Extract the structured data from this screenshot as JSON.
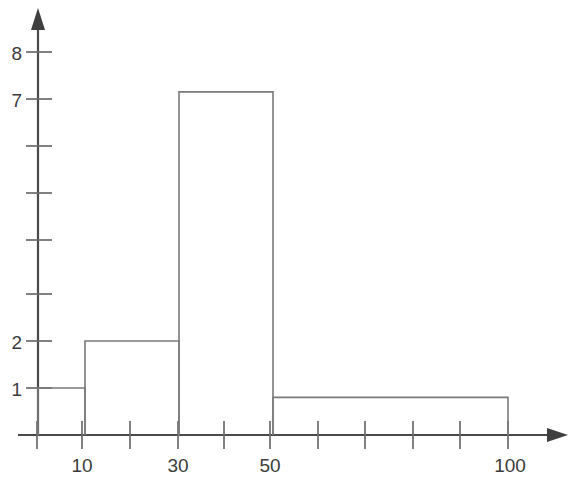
{
  "chart_data": {
    "type": "bar",
    "title": "",
    "subtitle": "",
    "xlabel": "",
    "ylabel": "",
    "grid": false,
    "legend": false,
    "legend_position": "none",
    "style": "histogram-outline-handdrawn",
    "bin_edges": [
      0,
      10,
      30,
      50,
      100
    ],
    "categories": [
      "0-10",
      "10-30",
      "30-50",
      "50-100"
    ],
    "values": [
      1,
      2,
      7.3,
      0.8
    ],
    "bars": [
      {
        "label": "0-10",
        "x0": 0,
        "x1": 10,
        "height": 1
      },
      {
        "label": "10-30",
        "x0": 10,
        "x1": 30,
        "height": 2
      },
      {
        "label": "30-50",
        "x0": 30,
        "x1": 50,
        "height": 7.3
      },
      {
        "label": "50-100",
        "x0": 50,
        "x1": 100,
        "height": 0.8
      }
    ],
    "xlim": [
      0,
      110
    ],
    "ylim": [
      0,
      8.6
    ],
    "x_tick_values": [
      0,
      10,
      20,
      30,
      40,
      50,
      60,
      70,
      80,
      90,
      100
    ],
    "x_tick_labels": [
      "",
      "10",
      "",
      "30",
      "",
      "50",
      "",
      "",
      "",
      "",
      "100"
    ],
    "y_tick_values": [
      1,
      2,
      3,
      4,
      5,
      6,
      7,
      8
    ],
    "y_tick_labels": [
      "1",
      "2",
      "",
      "",
      "",
      "",
      "7",
      "8"
    ],
    "colors": {
      "background": "#ffffff",
      "axis": "#4a4a4a",
      "tick": "#6b6b6b",
      "bar_outline": "#7a7a7a",
      "bar_fill": "none",
      "label_text": "#3c3c3c"
    }
  },
  "geometry": {
    "origin_x": 38,
    "baseline_y": 435,
    "unit_y_px": 47,
    "x_tick_step_px": 47,
    "y_axis_arrow_tip_y": 8,
    "x_axis_arrow_tip_x": 568
  }
}
